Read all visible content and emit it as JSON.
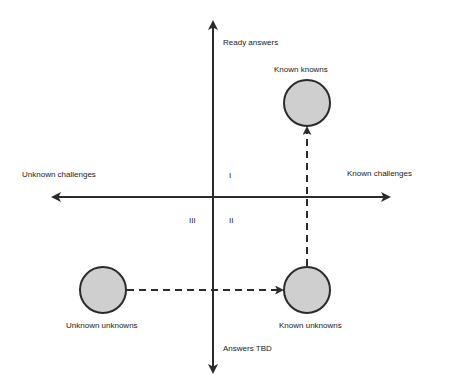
{
  "diagram": {
    "axes": {
      "vertical_top_label": "Ready answers",
      "vertical_bottom_label": "Answers TBD",
      "horizontal_left_label": "Unknown challenges",
      "horizontal_right_label": "Known challenges"
    },
    "quadrants": {
      "q1": "I",
      "q2": "II",
      "q3": "III"
    },
    "nodes": [
      {
        "id": "known-knowns",
        "label": "Known knowns"
      },
      {
        "id": "known-unknowns",
        "label": "Known unknowns"
      },
      {
        "id": "unknown-unknowns",
        "label": "Unknown unknowns"
      }
    ],
    "edges": [
      {
        "from": "unknown-unknowns",
        "to": "known-unknowns",
        "style": "dashed"
      },
      {
        "from": "known-unknowns",
        "to": "known-knowns",
        "style": "dashed"
      }
    ],
    "colors": {
      "line": "#2b2b2b",
      "node_fill": "#cfcfcf",
      "node_stroke": "#2b2b2b",
      "background": "#ffffff"
    }
  }
}
